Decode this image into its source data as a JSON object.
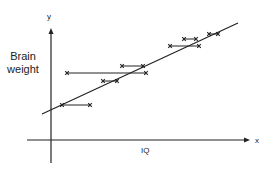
{
  "diagram": {
    "title": "",
    "y_axis": {
      "letter": "y",
      "label": "Brain weight"
    },
    "x_axis": {
      "letter": "x",
      "label": "IQ"
    },
    "colors": {
      "ink": "#222222",
      "background": "#ffffff"
    },
    "geometry": {
      "y_axis": {
        "x": 51,
        "y_top": 28,
        "y_bottom": 163
      },
      "x_axis": {
        "y": 140,
        "x_left": 27,
        "x_right": 250
      },
      "regression_line": {
        "x1": 42,
        "y1": 114,
        "x2": 238,
        "y2": 23
      },
      "segments": [
        {
          "y": 105,
          "x1": 62,
          "x2": 90
        },
        {
          "y": 81,
          "x1": 103,
          "x2": 117
        },
        {
          "y": 73,
          "x1": 67,
          "x2": 146
        },
        {
          "y": 66,
          "x1": 122,
          "x2": 143
        },
        {
          "y": 46,
          "x1": 170,
          "x2": 199
        },
        {
          "y": 39,
          "x1": 184,
          "x2": 196
        },
        {
          "y": 34,
          "x1": 209,
          "x2": 218
        }
      ]
    }
  }
}
